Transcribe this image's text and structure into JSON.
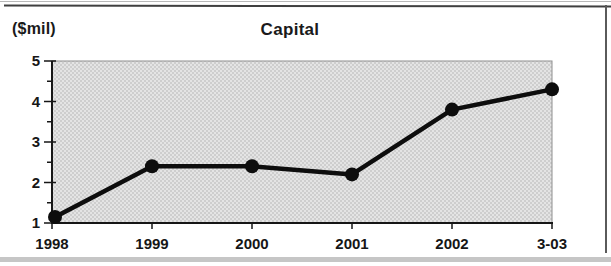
{
  "header": {
    "unit_label": "($mil)",
    "title": "Capital"
  },
  "chart_data": {
    "type": "line",
    "title": "Capital",
    "ylabel": "($mil)",
    "xlabel": "",
    "categories": [
      "1998",
      "1999",
      "2000",
      "2001",
      "2002",
      "3-03"
    ],
    "series": [
      {
        "name": "Capital",
        "values": [
          1.15,
          2.4,
          2.4,
          2.2,
          3.8,
          4.3
        ]
      }
    ],
    "ylim": [
      1,
      5
    ],
    "y_major_ticks": [
      1,
      2,
      3,
      4,
      5
    ],
    "y_minor_ticks": [
      1.5,
      2.5,
      3.5,
      4.5
    ],
    "grid": false,
    "legend": "none",
    "marker": "circle",
    "colors": {
      "line": "#0d0d0d",
      "marker": "#0d0d0d",
      "axis": "#161616",
      "plot_border": "#8f8f8f",
      "plot_fill_base": "#e4e4e4",
      "plot_fill_dot": "#adadad",
      "text": "#161616"
    }
  },
  "frame": {
    "top_edge_color": "#b8b8b8",
    "top_rule_color": "#3f3f3f",
    "right_rule_color": "#5a5a5a",
    "bottom_band_color": "#c6c6c6"
  }
}
